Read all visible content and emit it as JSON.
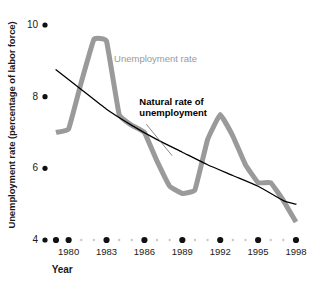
{
  "chart_data": {
    "type": "line",
    "title": "",
    "xlabel": "Year",
    "ylabel": "Unemployment rate (percentage of labor force)",
    "xlim": [
      1979,
      1998
    ],
    "ylim": [
      4,
      10
    ],
    "grid": false,
    "legend_position": "inline-annotations",
    "y_ticks": [
      {
        "label": "10",
        "value": 10
      },
      {
        "label": "8",
        "value": 8
      },
      {
        "label": "6",
        "value": 6
      },
      {
        "label": "4",
        "value": 4
      }
    ],
    "x_ticks": [
      {
        "label": "1980",
        "value": 1980
      },
      {
        "label": "1983",
        "value": 1983
      },
      {
        "label": "1986",
        "value": 1986
      },
      {
        "label": "1989",
        "value": 1989
      },
      {
        "label": "1992",
        "value": 1992
      },
      {
        "label": "1995",
        "value": 1995
      },
      {
        "label": "1998",
        "value": 1998
      }
    ],
    "x_minor_values": [
      1981,
      1982,
      1984,
      1985,
      1987,
      1988,
      1990,
      1991,
      1993,
      1994,
      1996,
      1997
    ],
    "series": [
      {
        "name": "Unemployment rate",
        "color": "#9a9a9a",
        "width": 5,
        "label_x": 1983.6,
        "label_y": 9.05,
        "x": [
          1979,
          1980,
          1981,
          1982,
          1983,
          1984,
          1985,
          1986,
          1987,
          1988,
          1989,
          1990,
          1991,
          1992,
          1993,
          1994,
          1995,
          1996,
          1997,
          1998
        ],
        "values": [
          7.0,
          7.1,
          8.4,
          9.6,
          9.55,
          7.5,
          7.2,
          7.0,
          6.2,
          5.5,
          5.3,
          5.4,
          6.8,
          7.5,
          6.9,
          6.1,
          5.6,
          5.6,
          5.1,
          4.5
        ]
      },
      {
        "name": "Natural rate of unemployment",
        "color": "#000000",
        "width": 1.3,
        "label_x": 1985.6,
        "label_y": 7.85,
        "leader_to_x": 1988.2,
        "leader_to_y": 6.35,
        "x": [
          1979,
          1981,
          1983,
          1985,
          1987,
          1989,
          1991,
          1993,
          1995,
          1997,
          1998
        ],
        "values": [
          8.75,
          8.2,
          7.65,
          7.2,
          6.8,
          6.45,
          6.1,
          5.8,
          5.5,
          5.1,
          5.0
        ]
      }
    ],
    "annotations": [
      {
        "text": "Unemployment rate",
        "style": "gray"
      },
      {
        "text": "Natural rate of",
        "style": "black"
      },
      {
        "text": "unemployment",
        "style": "black"
      }
    ],
    "colors": {
      "unemployment_rate": "#9a9a9a",
      "natural_rate": "#000000",
      "tick_major": "#111111",
      "tick_minor": "#c9c9c9",
      "background": "#ffffff"
    }
  }
}
